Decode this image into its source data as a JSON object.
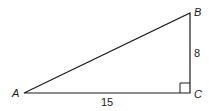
{
  "diagram": {
    "type": "right-triangle",
    "vertices": {
      "A": {
        "label": "A"
      },
      "B": {
        "label": "B"
      },
      "C": {
        "label": "C"
      }
    },
    "sides": {
      "BC": {
        "label": "8"
      },
      "AC": {
        "label": "15"
      }
    },
    "right_angle_at": "C",
    "stroke_color": "#1a1a1a"
  }
}
